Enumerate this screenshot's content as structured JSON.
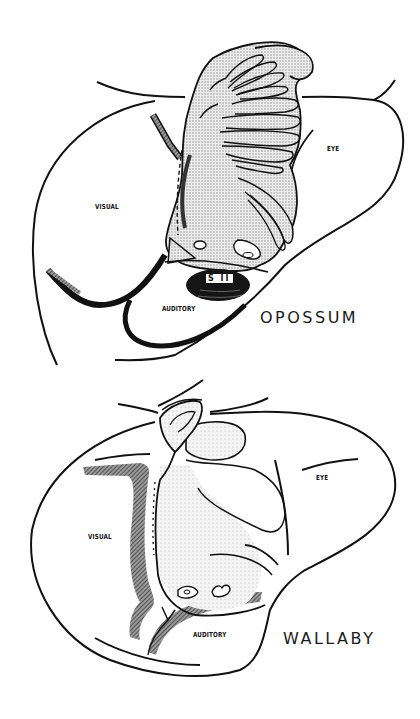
{
  "figures": {
    "opossum": {
      "species_label": "OPOSSUM",
      "areas": {
        "visual": "VISUAL",
        "eye": "EYE",
        "auditory": "AUDITORY",
        "second_somatic": "S II"
      }
    },
    "wallaby": {
      "species_label": "WALLABY",
      "areas": {
        "visual": "VISUAL",
        "eye": "EYE",
        "auditory": "AUDITORY"
      }
    }
  },
  "colors": {
    "line": "#111111",
    "stipple_fill": "#d9d9d9",
    "hatch_band": "#555555",
    "background": "#ffffff"
  }
}
